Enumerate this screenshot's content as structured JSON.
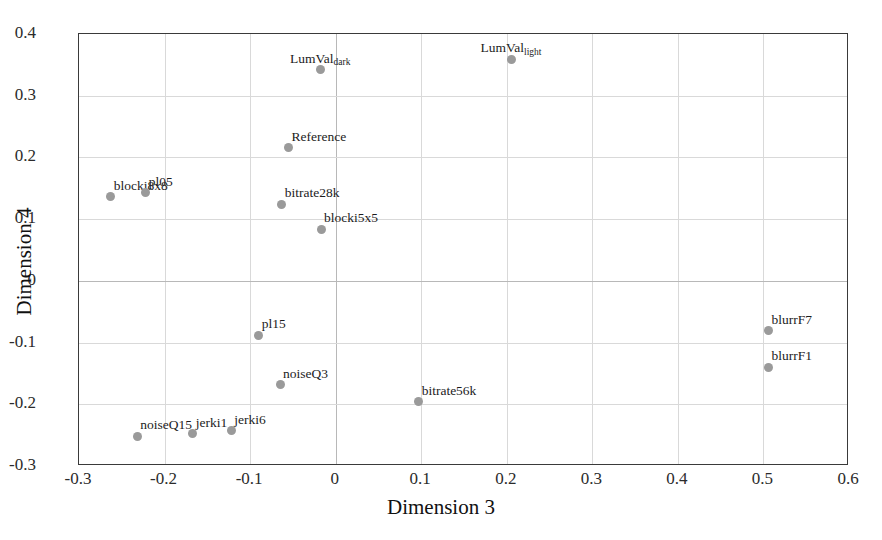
{
  "chart_data": {
    "type": "scatter",
    "title": "",
    "xlabel": "Dimension 3",
    "ylabel": "Dimension 4",
    "xlim": [
      -0.3,
      0.6
    ],
    "ylim": [
      -0.3,
      0.4
    ],
    "xticks": [
      "-0.3",
      "-0.2",
      "-0.1",
      "0",
      "0.1",
      "0.2",
      "0.3",
      "0.4",
      "0.5",
      "0.6"
    ],
    "xtick_values": [
      -0.3,
      -0.2,
      -0.1,
      0,
      0.1,
      0.2,
      0.3,
      0.4,
      0.5,
      0.6
    ],
    "yticks": [
      "0.4",
      "0.3",
      "0.2",
      "0.1",
      "0",
      "-0.1",
      "-0.2",
      "-0.3"
    ],
    "ytick_values": [
      0.4,
      0.3,
      0.2,
      0.1,
      0,
      -0.1,
      -0.2,
      -0.3
    ],
    "grid": true,
    "legend": false,
    "marker_color": "#9a9a9a",
    "points": [
      {
        "label": "LumVal",
        "sub": "dark",
        "x": -0.018,
        "y": 0.342,
        "lx": "center",
        "ly": "above"
      },
      {
        "label": "LumVal",
        "sub": "light",
        "x": 0.205,
        "y": 0.359,
        "lx": "center",
        "ly": "above"
      },
      {
        "label": "Reference",
        "sub": "",
        "x": -0.055,
        "y": 0.216,
        "lx": "right",
        "ly": "above"
      },
      {
        "label": "blocki8x8",
        "sub": "",
        "x": -0.263,
        "y": 0.136,
        "lx": "right",
        "ly": "above"
      },
      {
        "label": "pl05",
        "sub": "",
        "x": -0.222,
        "y": 0.143,
        "lx": "right",
        "ly": "above"
      },
      {
        "label": "bitrate28k",
        "sub": "",
        "x": -0.063,
        "y": 0.124,
        "lx": "right",
        "ly": "above"
      },
      {
        "label": "blocki5x5",
        "sub": "",
        "x": -0.017,
        "y": 0.084,
        "lx": "right",
        "ly": "above"
      },
      {
        "label": "blurrF7",
        "sub": "",
        "x": 0.506,
        "y": -0.081,
        "lx": "right",
        "ly": "above"
      },
      {
        "label": "blurrF1",
        "sub": "",
        "x": 0.506,
        "y": -0.14,
        "lx": "right",
        "ly": "above"
      },
      {
        "label": "pl15",
        "sub": "",
        "x": -0.09,
        "y": -0.088,
        "lx": "right",
        "ly": "above"
      },
      {
        "label": "noiseQ3",
        "sub": "",
        "x": -0.065,
        "y": -0.168,
        "lx": "right",
        "ly": "above"
      },
      {
        "label": "bitrate56k",
        "sub": "",
        "x": 0.097,
        "y": -0.196,
        "lx": "right",
        "ly": "above"
      },
      {
        "label": "noiseQ15",
        "sub": "",
        "x": -0.232,
        "y": -0.252,
        "lx": "right",
        "ly": "above"
      },
      {
        "label": "jerki1",
        "sub": "",
        "x": -0.167,
        "y": -0.248,
        "lx": "right",
        "ly": "above"
      },
      {
        "label": "jerki6",
        "sub": "",
        "x": -0.122,
        "y": -0.243,
        "lx": "right",
        "ly": "above"
      }
    ]
  },
  "axes": {
    "frame_color": "#3a3a3a",
    "grid_color": "#d9d9d9"
  }
}
